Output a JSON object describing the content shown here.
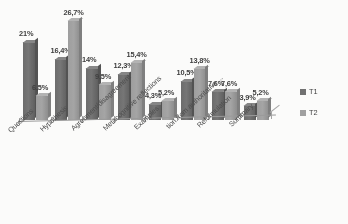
{
  "chart_data": {
    "type": "bar",
    "title": "",
    "subtitle": "",
    "xlabel": "",
    "ylabel": "",
    "grid": false,
    "legend_position": "right",
    "ylim": [
      0,
      28
    ],
    "decimal_separator": ",",
    "value_suffix": "%",
    "categories": [
      "Questions",
      "Hypothesis",
      "Agreement/disagreement",
      "Metacognitive reflections",
      "Examples",
      "tion from authoritative ...",
      "Reformulation",
      "Summary"
    ],
    "series": [
      {
        "name": "T1",
        "color": "#6f6f6f",
        "values": [
          21,
          16.4,
          14,
          12.3,
          4.3,
          10.5,
          7.6,
          3.9
        ],
        "labels": [
          "21%",
          "16,4%",
          "14%",
          "12,3%",
          "4,3%",
          "10,5%",
          "7,6%",
          "3,9%"
        ]
      },
      {
        "name": "T2",
        "color": "#a0a0a0",
        "values": [
          6.5,
          26.7,
          9.5,
          15.4,
          5.2,
          13.8,
          7.6,
          5.2
        ],
        "labels": [
          "6,5%",
          "26,7%",
          "9,5%",
          "15,4%",
          "5,2%",
          "13,8%",
          "7,6%",
          "5,2%"
        ]
      }
    ]
  },
  "legend": {
    "items": [
      {
        "label": "T1",
        "marker": "square-swatch-icon",
        "color": "#6f6f6f"
      },
      {
        "label": "T2",
        "marker": "square-swatch-icon",
        "color": "#a0a0a0"
      }
    ]
  }
}
